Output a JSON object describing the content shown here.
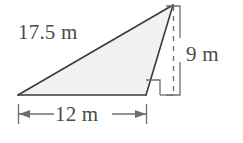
{
  "figure": {
    "kind": "geometry-diagram",
    "shape": "triangle",
    "colors": {
      "fill": "#f1f1f1",
      "stroke": "#3a3a3a",
      "guide": "#6e6e6e",
      "text": "#4a4a4a",
      "background": "#ffffff"
    },
    "labels": {
      "hypotenuse": "17.5 m",
      "height": "9 m",
      "base": "12 m"
    },
    "measurements": [
      {
        "name": "slant-side",
        "value": 17.5,
        "unit": "m",
        "text": "17.5 m"
      },
      {
        "name": "height",
        "value": 9,
        "unit": "m",
        "text": "9 m"
      },
      {
        "name": "base",
        "value": 12,
        "unit": "m",
        "text": "12 m"
      }
    ],
    "markers": {
      "right_angle": "right-angle-square",
      "base_dimension": "arrow-both-ends-with-ticks",
      "height_dimension": "bracket-with-dashed-extension"
    }
  }
}
